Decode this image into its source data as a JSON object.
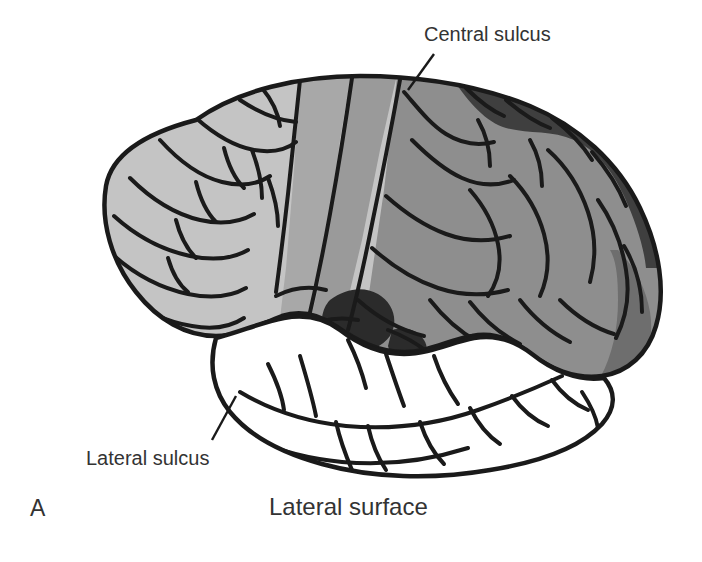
{
  "figure": {
    "panel_letter": "A",
    "caption": "Lateral surface",
    "view": "Lateral surface"
  },
  "annotations": [
    {
      "id": "central-sulcus",
      "label": "Central sulcus",
      "leader": "line from label down-left to dorsal brain margin"
    },
    {
      "id": "lateral-sulcus",
      "label": "Lateral sulcus",
      "leader": "line from label up-right to anterior tip of lateral sulcus"
    }
  ],
  "colors": {
    "background": "#ffffff",
    "outline": "#1a1a1a",
    "text": "#333333",
    "frontal_lobe": "#c4c4c4",
    "precentral_band": "#a8a8a8",
    "postcentral_band": "#9a9a9a",
    "parietal_lobe": "#8e8e8e",
    "posterior_dark": "#3f3f3f",
    "occipital_wedge": "#6e6e6e",
    "insula_dark": "#2b2b2b",
    "temporal_lobe": "#ffffff"
  },
  "regions": [
    {
      "name": "frontal-lobe",
      "shade": "light gray",
      "color": "#c4c4c4"
    },
    {
      "name": "precentral-band",
      "shade": "medium light gray",
      "color": "#a8a8a8"
    },
    {
      "name": "postcentral-band",
      "shade": "medium gray",
      "color": "#9a9a9a"
    },
    {
      "name": "parietal-lobe",
      "shade": "medium gray",
      "color": "#8e8e8e"
    },
    {
      "name": "posterior-superior-dark",
      "shade": "dark gray",
      "color": "#3f3f3f"
    },
    {
      "name": "occipital-wedge",
      "shade": "mid dark gray",
      "color": "#6e6e6e"
    },
    {
      "name": "insula",
      "shade": "very dark gray",
      "color": "#2b2b2b"
    },
    {
      "name": "temporal-lobe",
      "shade": "white",
      "color": "#ffffff"
    }
  ]
}
